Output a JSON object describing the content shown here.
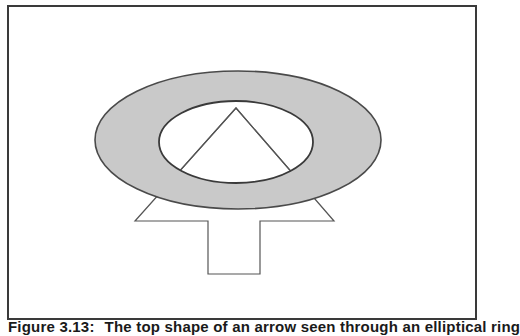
{
  "figure": {
    "frame": {
      "border_color": "#3a3a3a",
      "background": "#ffffff"
    },
    "shapes": {
      "outer_ellipse": {
        "cx": 238,
        "cy": 140,
        "rx": 143,
        "ry": 69,
        "fill": "#c9c9c9",
        "stroke": "#4a4a4a"
      },
      "inner_ellipse": {
        "cx": 236,
        "cy": 142,
        "rx": 77,
        "ry": 41,
        "fill": "#ffffff",
        "stroke": "#3a3a3a"
      },
      "arrow": {
        "points": "236,108 334,221 260,221 260,274 208,274 208,221 135,221",
        "fill": "#ffffff",
        "stroke": "#555555"
      }
    },
    "caption": {
      "number": "Figure 3.13:",
      "text": "The top shape of an arrow seen through an elliptical ring"
    }
  }
}
